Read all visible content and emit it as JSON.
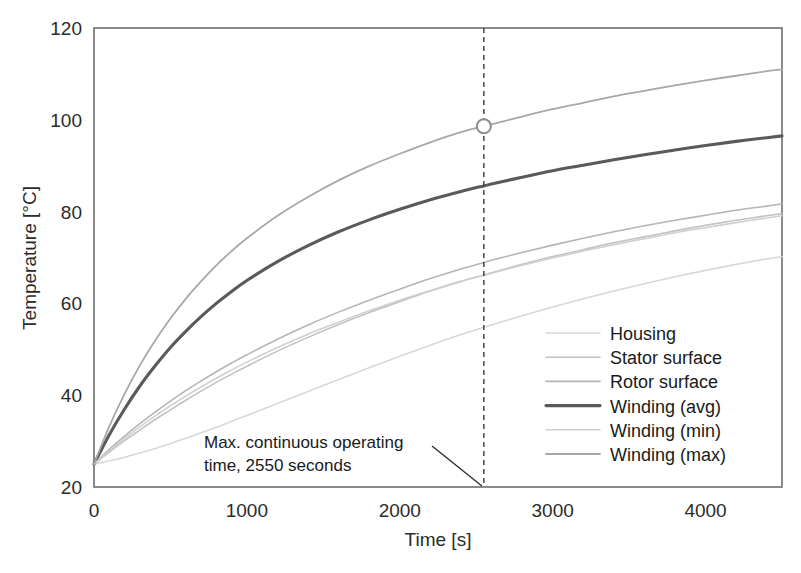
{
  "chart_data": {
    "type": "line",
    "title": "",
    "xlabel": "Time [s]",
    "ylabel": "Temperature [°C]",
    "xlim": [
      0,
      4500
    ],
    "ylim": [
      20,
      120
    ],
    "xticks": [
      0,
      1000,
      2000,
      3000,
      4000
    ],
    "xtick_labels": [
      "0",
      "1000",
      "2000",
      "3000",
      "4000"
    ],
    "yticks": [
      20,
      40,
      60,
      80,
      100,
      120
    ],
    "ytick_labels": [
      "20",
      "40",
      "60",
      "80",
      "100",
      "120"
    ],
    "grid": false,
    "legend_position": "center-right-inside",
    "x": [
      0,
      100,
      200,
      300,
      400,
      500,
      600,
      700,
      800,
      900,
      1000,
      1200,
      1400,
      1600,
      1800,
      2000,
      2200,
      2400,
      2550,
      2600,
      2800,
      3000,
      3200,
      3400,
      3600,
      3800,
      4000,
      4200,
      4400,
      4500
    ],
    "series": [
      {
        "name": "Housing",
        "color": "#d8d8d8",
        "width": 1.6,
        "values": [
          25.0,
          25.7,
          26.5,
          27.4,
          28.4,
          29.5,
          30.6,
          31.8,
          33.0,
          34.3,
          35.6,
          38.2,
          40.8,
          43.4,
          46.0,
          48.5,
          50.9,
          53.2,
          54.8,
          55.3,
          57.3,
          59.2,
          61.0,
          62.7,
          64.3,
          65.8,
          67.2,
          68.5,
          69.7,
          70.2
        ]
      },
      {
        "name": "Stator surface",
        "color": "#c2c2c2",
        "width": 1.6,
        "values": [
          25.0,
          27.6,
          30.1,
          32.4,
          34.7,
          36.8,
          38.9,
          40.9,
          42.8,
          44.6,
          46.3,
          49.6,
          52.6,
          55.4,
          58.0,
          60.4,
          62.7,
          64.8,
          66.2,
          66.7,
          68.5,
          70.2,
          71.7,
          73.2,
          74.5,
          75.8,
          77.0,
          78.1,
          79.1,
          79.6
        ]
      },
      {
        "name": "Rotor surface",
        "color": "#b5b5b5",
        "width": 1.6,
        "values": [
          25.0,
          28.2,
          31.1,
          33.8,
          36.3,
          38.7,
          41.0,
          43.1,
          45.1,
          47.0,
          48.8,
          52.2,
          55.3,
          58.1,
          60.7,
          63.1,
          65.4,
          67.5,
          68.9,
          69.4,
          71.1,
          72.7,
          74.2,
          75.6,
          76.9,
          78.1,
          79.2,
          80.3,
          81.2,
          81.7
        ]
      },
      {
        "name": "Winding (avg)",
        "color": "#5a5a5a",
        "width": 3.1,
        "values": [
          25.0,
          31.4,
          37.0,
          42.0,
          46.4,
          50.4,
          53.9,
          57.1,
          60.0,
          62.6,
          65.0,
          69.1,
          72.6,
          75.6,
          78.2,
          80.5,
          82.6,
          84.4,
          85.6,
          86.0,
          87.5,
          88.9,
          90.1,
          91.3,
          92.4,
          93.4,
          94.4,
          95.3,
          96.1,
          96.5
        ]
      },
      {
        "name": "Winding (min)",
        "color": "#d0d0d0",
        "width": 1.6,
        "values": [
          25.0,
          27.9,
          30.6,
          33.1,
          35.5,
          37.7,
          39.8,
          41.8,
          43.7,
          45.5,
          47.2,
          50.4,
          53.3,
          55.9,
          58.4,
          60.7,
          62.8,
          64.8,
          66.1,
          66.6,
          68.3,
          69.9,
          71.4,
          72.8,
          74.1,
          75.4,
          76.5,
          77.6,
          78.6,
          79.1
        ]
      },
      {
        "name": "Winding (max)",
        "color": "#a8a8a8",
        "width": 1.8,
        "values": [
          25.0,
          33.2,
          40.3,
          46.5,
          51.9,
          56.7,
          61.0,
          64.8,
          68.3,
          71.4,
          74.2,
          79.1,
          83.2,
          86.8,
          89.9,
          92.6,
          95.1,
          97.3,
          98.6,
          99.0,
          100.7,
          102.3,
          103.7,
          105.1,
          106.3,
          107.5,
          108.6,
          109.6,
          110.6,
          111.0
        ]
      }
    ],
    "annotations": [
      {
        "name": "max-continuous-operating-time",
        "text_line1": "Max. continuous operating",
        "text_line2": "time, 2550 seconds",
        "target_x": 2550,
        "marker_series": "Winding (max)",
        "marker_x": 2550,
        "marker_y": 98.6,
        "vertical_line_x": 2550
      }
    ]
  }
}
